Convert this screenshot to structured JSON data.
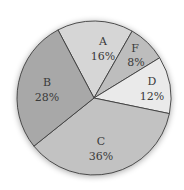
{
  "chart_data": {
    "type": "pie",
    "title": "",
    "slices": [
      {
        "label": "A",
        "value": 16,
        "display": "16%",
        "color": "#d6d6d6"
      },
      {
        "label": "F",
        "value": 8,
        "display": "8%",
        "color": "#bdbdbd"
      },
      {
        "label": "D",
        "value": 12,
        "display": "12%",
        "color": "#eaeaea"
      },
      {
        "label": "C",
        "value": 36,
        "display": "36%",
        "color": "#c2c2c2"
      },
      {
        "label": "B",
        "value": 28,
        "display": "28%",
        "color": "#a8a8a8"
      }
    ],
    "legend": "none",
    "labels_inside": true
  }
}
